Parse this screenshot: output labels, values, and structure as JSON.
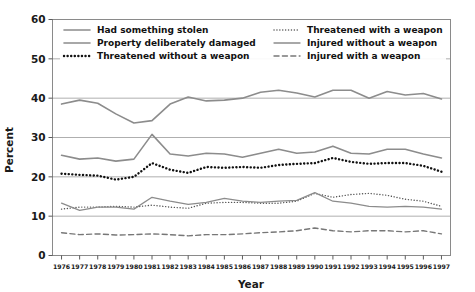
{
  "chart_data": {
    "type": "line",
    "title": "",
    "xlabel": "Year",
    "ylabel": "Percent",
    "ylim": [
      0,
      60
    ],
    "yticks": [
      0,
      10,
      20,
      30,
      40,
      50,
      60
    ],
    "grid": true,
    "legend_position": "top-inside",
    "x": [
      1976,
      1977,
      1978,
      1979,
      1980,
      1981,
      1982,
      1983,
      1984,
      1985,
      1986,
      1987,
      1988,
      1989,
      1990,
      1991,
      1992,
      1993,
      1994,
      1995,
      1996,
      1997
    ],
    "categories": [
      "1976",
      "1977",
      "1978",
      "1979",
      "1980",
      "1981",
      "1982",
      "1983",
      "1984",
      "1985",
      "1986",
      "1987",
      "1988",
      "1989",
      "1990",
      "1991",
      "1992",
      "1993",
      "1994",
      "1995",
      "1996",
      "1997"
    ],
    "series": [
      {
        "name": "Had something stolen",
        "style": "solid",
        "color": "#8c8c8c",
        "width": 1.6,
        "values": [
          38.5,
          39.5,
          38.7,
          36.0,
          33.7,
          34.3,
          38.5,
          40.3,
          39.3,
          39.5,
          40.0,
          41.5,
          42.0,
          41.3,
          40.3,
          42.0,
          42.0,
          40.0,
          41.7,
          40.8,
          41.2,
          39.8
        ]
      },
      {
        "name": "Property deliberately damaged",
        "style": "solid",
        "color": "#8c8c8c",
        "width": 1.6,
        "values": [
          25.5,
          24.5,
          24.8,
          24.0,
          24.5,
          30.8,
          25.8,
          25.3,
          26.0,
          25.8,
          25.0,
          26.0,
          27.0,
          26.0,
          26.3,
          27.8,
          26.0,
          25.8,
          27.0,
          27.0,
          25.8,
          24.8
        ]
      },
      {
        "name": "Threatened without a weapon",
        "style": "dotted",
        "color": "#111111",
        "width": 2.4,
        "values": [
          20.8,
          20.5,
          20.3,
          19.3,
          20.0,
          23.5,
          21.8,
          21.0,
          22.5,
          22.3,
          22.5,
          22.3,
          23.0,
          23.3,
          23.5,
          24.8,
          23.8,
          23.3,
          23.5,
          23.5,
          22.8,
          21.3
        ]
      },
      {
        "name": "Threatened with a weapon",
        "style": "dotted",
        "color": "#555555",
        "width": 1.4,
        "values": [
          11.8,
          12.3,
          12.3,
          12.5,
          12.3,
          12.8,
          12.3,
          12.0,
          13.3,
          13.5,
          13.5,
          13.3,
          13.3,
          13.8,
          15.8,
          14.8,
          15.5,
          15.8,
          15.3,
          14.3,
          13.8,
          12.5
        ]
      },
      {
        "name": "Injured without a weapon",
        "style": "solid",
        "color": "#8c8c8c",
        "width": 1.3,
        "values": [
          13.3,
          11.5,
          12.3,
          12.3,
          11.8,
          14.8,
          13.8,
          13.0,
          13.5,
          14.5,
          13.8,
          13.5,
          13.8,
          14.0,
          16.0,
          13.8,
          13.3,
          12.5,
          12.3,
          12.5,
          12.3,
          11.8
        ]
      },
      {
        "name": "Injured with a weapon",
        "style": "dashed",
        "color": "#777777",
        "width": 1.4,
        "values": [
          5.8,
          5.3,
          5.5,
          5.2,
          5.3,
          5.5,
          5.3,
          5.0,
          5.3,
          5.3,
          5.5,
          5.8,
          6.0,
          6.3,
          7.0,
          6.3,
          6.0,
          6.3,
          6.3,
          6.0,
          6.3,
          5.5
        ]
      }
    ]
  },
  "legend": {
    "entries": [
      {
        "label": "Had something stolen",
        "style": "solid",
        "color": "#8c8c8c"
      },
      {
        "label": "Property deliberately damaged",
        "style": "solid",
        "color": "#8c8c8c"
      },
      {
        "label": "Threatened without a weapon",
        "style": "dotted",
        "color": "#111111"
      },
      {
        "label": "Threatened with a weapon",
        "style": "dotted",
        "color": "#777777"
      },
      {
        "label": "Injured without a weapon",
        "style": "solid",
        "color": "#8c8c8c"
      },
      {
        "label": "Injured with a weapon",
        "style": "dashed",
        "color": "#777777"
      }
    ]
  },
  "axes": {
    "y_label": "Percent",
    "x_label": "Year",
    "y_ticks": [
      "0",
      "10",
      "20",
      "30",
      "40",
      "50",
      "60"
    ],
    "x_ticks": [
      "1976",
      "1977",
      "1978",
      "1979",
      "1980",
      "1981",
      "1982",
      "1983",
      "1984",
      "1985",
      "1986",
      "1987",
      "1988",
      "1989",
      "1990",
      "1991",
      "1992",
      "1993",
      "1994",
      "1995",
      "1996",
      "1997"
    ]
  },
  "colors": {
    "grey_series": "#8c8c8c",
    "black_series": "#111111",
    "gridline": "#9a9a9a",
    "border": "#8a8a8a",
    "background": "#ffffff"
  }
}
